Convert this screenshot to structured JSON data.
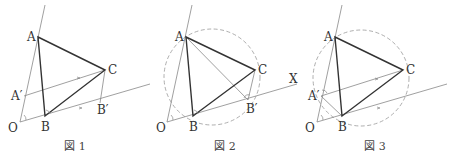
{
  "figures": [
    {
      "caption": "図 1",
      "labels": {
        "A": "A",
        "B": "B",
        "C": "C",
        "O": "O",
        "A_prime": "A′",
        "B_prime": "B′"
      }
    },
    {
      "caption": "図 2",
      "labels": {
        "A": "A",
        "B": "B",
        "C": "C",
        "O": "O",
        "B_prime": "B′",
        "X": "X"
      }
    },
    {
      "caption": "図 3",
      "labels": {
        "A": "A",
        "B": "B",
        "C": "C",
        "O": "O",
        "A_prime": "A′"
      }
    }
  ],
  "colors": {
    "triangle": "#333333",
    "construction": "#888888",
    "circle": "#999999"
  }
}
